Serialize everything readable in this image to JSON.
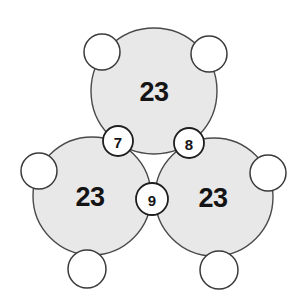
{
  "page": {
    "background_color": "#ffffff",
    "width": 306,
    "height": 301
  },
  "style": {
    "big_circle_fill": "#e8e8e8",
    "big_circle_stroke": "#4a4a4a",
    "small_circle_fill": "#ffffff",
    "small_circle_stroke": "#3a3a3a",
    "label_color": "#141414"
  },
  "chart_data": {
    "type": "diagram",
    "big_circles": [
      {
        "id": "top",
        "label": "23",
        "cx": 154,
        "cy": 91,
        "r": 63
      },
      {
        "id": "bottom-left",
        "label": "23",
        "cx": 92,
        "cy": 196,
        "r": 59
      },
      {
        "id": "bottom-right",
        "label": "23",
        "cx": 214,
        "cy": 197,
        "r": 59
      }
    ],
    "junction_nodes": [
      {
        "id": "junction-top-left",
        "label": "7",
        "cx": 118,
        "cy": 141,
        "r": 15
      },
      {
        "id": "junction-top-right",
        "label": "8",
        "cx": 189,
        "cy": 143,
        "r": 15
      },
      {
        "id": "junction-bottom-center",
        "label": "9",
        "cx": 152,
        "cy": 199,
        "r": 16
      }
    ],
    "outer_nodes": [
      {
        "id": "outer-top-left",
        "label": "",
        "cx": 102,
        "cy": 52,
        "r": 18
      },
      {
        "id": "outer-top-right",
        "label": "",
        "cx": 209,
        "cy": 54,
        "r": 18
      },
      {
        "id": "outer-left",
        "label": "",
        "cx": 39,
        "cy": 171,
        "r": 18
      },
      {
        "id": "outer-right",
        "label": "",
        "cx": 268,
        "cy": 173,
        "r": 18
      },
      {
        "id": "outer-bottom-left",
        "label": "",
        "cx": 87,
        "cy": 269,
        "r": 19
      },
      {
        "id": "outer-bottom-right",
        "label": "",
        "cx": 219,
        "cy": 270,
        "r": 19
      }
    ]
  }
}
